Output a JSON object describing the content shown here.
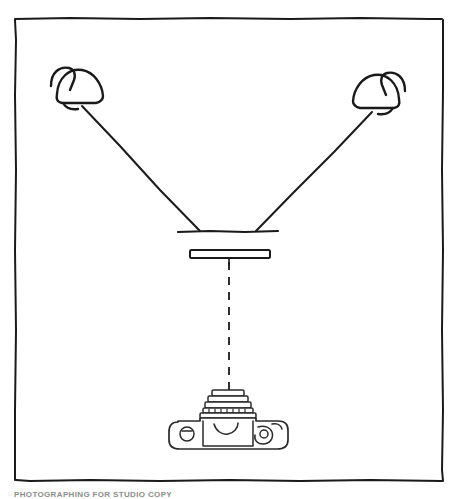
{
  "figure": {
    "background_color": "#ffffff",
    "ink_color": "#1a1a1a",
    "caption_color": "#8d8d8d",
    "frame": {
      "label": "hand-drawn rectangular border",
      "left": 14,
      "top": 18,
      "right": 443,
      "bottom": 481
    },
    "caption": {
      "text": "PHOTOGRAPHING FOR STUDIO COPY",
      "visible": "partially cropped at bottom edge"
    },
    "elements": {
      "lamp_left": {
        "name": "left lamp",
        "shade_center_x": 78,
        "shade_center_y": 92,
        "stem_angle": "up-left"
      },
      "lamp_right": {
        "name": "right lamp",
        "shade_center_x": 380,
        "shade_center_y": 97,
        "stem_angle": "up-right"
      },
      "ray_left": {
        "name": "left light ray",
        "from_x": 83,
        "from_y": 106,
        "to_x": 200,
        "to_y": 231
      },
      "ray_right": {
        "name": "right light ray",
        "from_x": 372,
        "from_y": 112,
        "to_x": 255,
        "to_y": 231
      },
      "subject_plane": {
        "name": "subject plane line",
        "x1": 178,
        "y1": 232,
        "x2": 278,
        "y2": 232
      },
      "lens_element": {
        "name": "lens element rectangle",
        "x": 190,
        "y": 250,
        "width": 80,
        "height": 8
      },
      "optical_axis": {
        "name": "dashed optical axis",
        "x": 229,
        "from_y": 258,
        "to_y": 392,
        "style": "dashed"
      },
      "camera": {
        "name": "35mm camera, front view",
        "body_x": 175,
        "body_y": 410,
        "body_width": 108,
        "body_height": 36,
        "lens_barrel_rings": 5
      }
    }
  }
}
